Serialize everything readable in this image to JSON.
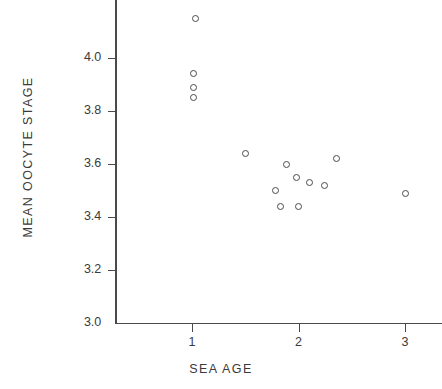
{
  "chart_data": {
    "type": "scatter",
    "title": "",
    "xlabel": "SEA AGE",
    "ylabel": "MEAN OOCYTE STAGE",
    "xlim": [
      0.28,
      3.35
    ],
    "ylim": [
      3.0,
      4.22
    ],
    "grid": false,
    "legend": null,
    "xticks": [
      1,
      2,
      3
    ],
    "xtick_labels": [
      "1",
      "2",
      "3"
    ],
    "yticks": [
      3.0,
      3.2,
      3.4,
      3.6,
      3.8,
      4.0
    ],
    "ytick_labels": [
      "3.0",
      "3.2",
      "3.4",
      "3.6",
      "3.8",
      "4.0"
    ],
    "marker": "open-circle",
    "marker_color": "#4a4a4a",
    "points": [
      {
        "x": 1.03,
        "y": 4.15
      },
      {
        "x": 1.01,
        "y": 3.94
      },
      {
        "x": 1.01,
        "y": 3.89
      },
      {
        "x": 1.01,
        "y": 3.85
      },
      {
        "x": 1.5,
        "y": 3.64
      },
      {
        "x": 1.89,
        "y": 3.6
      },
      {
        "x": 2.36,
        "y": 3.62
      },
      {
        "x": 1.98,
        "y": 3.55
      },
      {
        "x": 2.1,
        "y": 3.53
      },
      {
        "x": 2.24,
        "y": 3.52
      },
      {
        "x": 1.78,
        "y": 3.5
      },
      {
        "x": 1.83,
        "y": 3.44
      },
      {
        "x": 2.0,
        "y": 3.44
      },
      {
        "x": 3.0,
        "y": 3.49
      }
    ]
  },
  "axes": {
    "background_color": "#ffffff",
    "line_color": "#4a4a4a",
    "text_color": "#3a3a3a"
  }
}
